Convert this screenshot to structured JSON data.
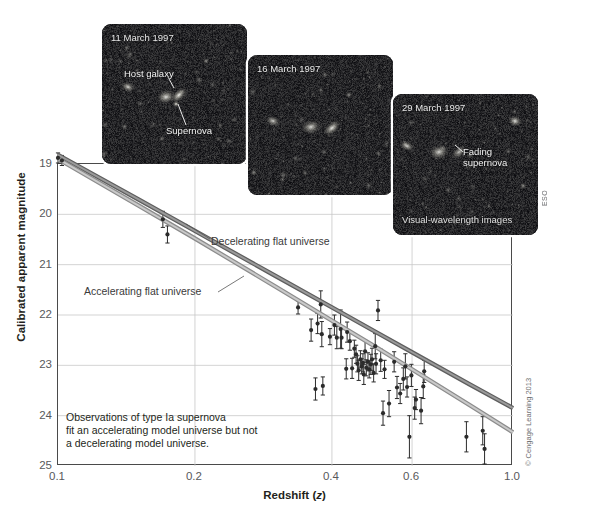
{
  "chart_data": {
    "type": "scatter",
    "title": "",
    "xlabel": "Redshift (z)",
    "ylabel": "Calibrated apparent magnitude",
    "xscale": "log",
    "xlim": [
      0.1,
      1.0
    ],
    "ylim": [
      25,
      19
    ],
    "y_inverted": true,
    "grid": true,
    "xticks": [
      0.1,
      0.2,
      0.4,
      0.6,
      1.0
    ],
    "xticklabels": [
      "0.1",
      "0.2",
      "0.4",
      "0.6",
      "1.0"
    ],
    "yticks": [
      19,
      20,
      21,
      22,
      23,
      24,
      25
    ],
    "yticklabels": [
      "19",
      "20",
      "21",
      "22",
      "23",
      "24",
      "25"
    ],
    "series": [
      {
        "name": "Decelerating flat universe",
        "type": "line",
        "color": "#7b7b7b",
        "label_text": "Decelerating flat universe",
        "x": [
          0.1,
          0.15,
          0.2,
          0.3,
          0.4,
          0.5,
          0.6,
          0.8,
          1.0
        ],
        "y": [
          18.82,
          19.7,
          20.33,
          21.22,
          21.85,
          22.34,
          22.74,
          23.37,
          23.85
        ]
      },
      {
        "name": "Accelerating flat universe",
        "type": "line",
        "color": "#adadad",
        "label_text": "Accelerating flat universe",
        "x": [
          0.1,
          0.15,
          0.2,
          0.3,
          0.4,
          0.5,
          0.6,
          0.8,
          1.0
        ],
        "y": [
          18.9,
          19.82,
          20.48,
          21.43,
          22.11,
          22.64,
          23.08,
          23.78,
          24.33
        ]
      },
      {
        "name": "Type Ia supernova observations",
        "type": "scatter",
        "color": "#2b2b2b",
        "points": [
          {
            "x": 0.1,
            "y": 18.88,
            "err": 0.1
          },
          {
            "x": 0.102,
            "y": 18.93,
            "err": 0.1
          },
          {
            "x": 0.17,
            "y": 20.1,
            "err": 0.16
          },
          {
            "x": 0.174,
            "y": 20.4,
            "err": 0.17
          },
          {
            "x": 0.337,
            "y": 21.85,
            "err": 0.13
          },
          {
            "x": 0.36,
            "y": 22.3,
            "err": 0.22
          },
          {
            "x": 0.372,
            "y": 22.17,
            "err": 0.2
          },
          {
            "x": 0.378,
            "y": 21.79,
            "err": 0.27
          },
          {
            "x": 0.38,
            "y": 22.38,
            "err": 0.25
          },
          {
            "x": 0.382,
            "y": 23.41,
            "err": 0.18
          },
          {
            "x": 0.396,
            "y": 22.43,
            "err": 0.16
          },
          {
            "x": 0.405,
            "y": 22.2,
            "err": 0.2
          },
          {
            "x": 0.41,
            "y": 22.45,
            "err": 0.22
          },
          {
            "x": 0.418,
            "y": 22.28,
            "err": 0.38
          },
          {
            "x": 0.42,
            "y": 22.45,
            "err": 0.22
          },
          {
            "x": 0.432,
            "y": 22.34,
            "err": 0.2
          },
          {
            "x": 0.438,
            "y": 22.52,
            "err": 0.18
          },
          {
            "x": 0.443,
            "y": 23.06,
            "err": 0.2
          },
          {
            "x": 0.448,
            "y": 22.67,
            "err": 0.17
          },
          {
            "x": 0.452,
            "y": 22.78,
            "err": 0.18
          },
          {
            "x": 0.455,
            "y": 22.97,
            "err": 0.16
          },
          {
            "x": 0.458,
            "y": 23.1,
            "err": 0.2
          },
          {
            "x": 0.462,
            "y": 22.88,
            "err": 0.17
          },
          {
            "x": 0.465,
            "y": 23.02,
            "err": 0.15
          },
          {
            "x": 0.468,
            "y": 22.95,
            "err": 0.18
          },
          {
            "x": 0.47,
            "y": 23.18,
            "err": 0.2
          },
          {
            "x": 0.473,
            "y": 22.72,
            "err": 0.22
          },
          {
            "x": 0.476,
            "y": 23.05,
            "err": 0.16
          },
          {
            "x": 0.48,
            "y": 22.93,
            "err": 0.18
          },
          {
            "x": 0.483,
            "y": 23.08,
            "err": 0.17
          },
          {
            "x": 0.487,
            "y": 22.98,
            "err": 0.2
          },
          {
            "x": 0.49,
            "y": 22.88,
            "err": 0.22
          },
          {
            "x": 0.494,
            "y": 23.15,
            "err": 0.18
          },
          {
            "x": 0.498,
            "y": 22.62,
            "err": 0.25
          },
          {
            "x": 0.5,
            "y": 22.97,
            "err": 0.2
          },
          {
            "x": 0.505,
            "y": 21.91,
            "err": 0.2
          },
          {
            "x": 0.512,
            "y": 22.9,
            "err": 0.22
          },
          {
            "x": 0.522,
            "y": 23.08,
            "err": 0.18
          },
          {
            "x": 0.534,
            "y": 23.76,
            "err": 0.26
          },
          {
            "x": 0.548,
            "y": 22.93,
            "err": 0.2
          },
          {
            "x": 0.556,
            "y": 23.44,
            "err": 0.22
          },
          {
            "x": 0.565,
            "y": 23.56,
            "err": 0.2
          },
          {
            "x": 0.574,
            "y": 23.27,
            "err": 0.22
          },
          {
            "x": 0.58,
            "y": 23.02,
            "err": 0.25
          },
          {
            "x": 0.585,
            "y": 23.43,
            "err": 0.2
          },
          {
            "x": 0.592,
            "y": 24.42,
            "err": 0.42
          },
          {
            "x": 0.598,
            "y": 23.2,
            "err": 0.22
          },
          {
            "x": 0.608,
            "y": 23.85,
            "err": 0.22
          },
          {
            "x": 0.612,
            "y": 23.68,
            "err": 0.2
          },
          {
            "x": 0.628,
            "y": 23.9,
            "err": 0.26
          },
          {
            "x": 0.635,
            "y": 23.42,
            "err": 0.24
          },
          {
            "x": 0.638,
            "y": 23.12,
            "err": 0.22
          },
          {
            "x": 0.79,
            "y": 24.42,
            "err": 0.3
          },
          {
            "x": 0.368,
            "y": 23.47,
            "err": 0.22
          },
          {
            "x": 0.43,
            "y": 23.07,
            "err": 0.2
          },
          {
            "x": 0.518,
            "y": 23.95,
            "err": 0.24
          },
          {
            "x": 0.858,
            "y": 24.3,
            "err": 0.28
          },
          {
            "x": 0.866,
            "y": 24.66,
            "err": 0.3
          }
        ]
      }
    ],
    "annotations": [
      "Observations of type Ia supernova",
      "fit an accelerating model universe but not",
      "a decelerating model universe."
    ]
  },
  "axes": {
    "y_title": "Calibrated apparent magnitude",
    "x_title_main": "Redshift (",
    "x_title_italic": "z",
    "x_title_close": ")"
  },
  "curve_labels": {
    "decelerating": "Decelerating flat universe",
    "accelerating": "Accelerating flat universe"
  },
  "annotation": {
    "line1": "Observations of type Ia supernova",
    "line2": "fit an accelerating model universe but not",
    "line3": "a decelerating model universe."
  },
  "panels": [
    {
      "id": "panel-1",
      "date": "11 March 1997",
      "labels": [
        "Host galaxy",
        "Supernova"
      ]
    },
    {
      "id": "panel-2",
      "date": "16 March 1997",
      "labels": []
    },
    {
      "id": "panel-3",
      "date": "29 March 1997",
      "labels": [
        "Fading",
        "supernova"
      ],
      "note": "Visual-wavelength images"
    }
  ],
  "panel1": {
    "date": "11 March 1997",
    "host_label": "Host galaxy",
    "sn_label": "Supernova"
  },
  "panel2": {
    "date": "16 March 1997"
  },
  "panel3": {
    "date": "29 March 1997",
    "fading_line1": "Fading",
    "fading_line2": "supernova",
    "note": "Visual-wavelength images"
  },
  "credits": {
    "eso": "ESO",
    "cengage": "© Cengage Learning 2013"
  },
  "colors": {
    "decelerating_curve": "#6f6f6f",
    "accelerating_curve": "#b0b0b0",
    "data_point": "#2b2b2b",
    "grid": "#c8c8c8",
    "frame": "#4a4a4a",
    "tick_text": "#58595b",
    "panel_bg": "#060608"
  }
}
